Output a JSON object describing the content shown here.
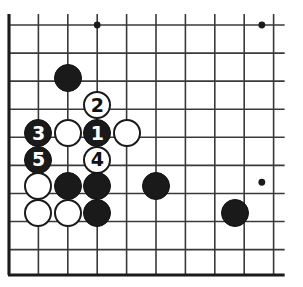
{
  "figure": {
    "kind": "go-board-diagram",
    "board": {
      "columns": 10,
      "rows": 10,
      "cell_size": 29.4,
      "origin_x": 9,
      "origin_y": 25,
      "line_color": "#3a3a3a",
      "border_color": "#1a1a1a",
      "background_color": "#ffffff",
      "edges": {
        "left": true,
        "bottom": true,
        "top": false,
        "right": false
      }
    },
    "star_points": [
      {
        "col": 3,
        "row": 0
      },
      {
        "col": 8.6,
        "row": 0
      },
      {
        "col": 8.6,
        "row": 5.6
      }
    ],
    "stones": [
      {
        "id": "b-a",
        "color": "black",
        "label": "",
        "col": 2,
        "row": 1.9
      },
      {
        "id": "w-2",
        "color": "white",
        "label": "2",
        "col": 3,
        "row": 2.85
      },
      {
        "id": "b-3",
        "color": "black",
        "label": "3",
        "col": 1,
        "row": 3.85
      },
      {
        "id": "w-b",
        "color": "white",
        "label": "",
        "col": 2,
        "row": 3.85
      },
      {
        "id": "b-1",
        "color": "black",
        "label": "1",
        "col": 3,
        "row": 3.85
      },
      {
        "id": "w-c",
        "color": "white",
        "label": "",
        "col": 4,
        "row": 3.85
      },
      {
        "id": "b-5",
        "color": "black",
        "label": "5",
        "col": 1,
        "row": 4.8
      },
      {
        "id": "w-4",
        "color": "white",
        "label": "4",
        "col": 3,
        "row": 4.8
      },
      {
        "id": "w-d",
        "color": "white",
        "label": "",
        "col": 1,
        "row": 5.75
      },
      {
        "id": "b-e",
        "color": "black",
        "label": "",
        "col": 2,
        "row": 5.75
      },
      {
        "id": "b-f",
        "color": "black",
        "label": "",
        "col": 3,
        "row": 5.75
      },
      {
        "id": "b-g",
        "color": "black",
        "label": "",
        "col": 5,
        "row": 5.75
      },
      {
        "id": "w-h",
        "color": "white",
        "label": "",
        "col": 1,
        "row": 6.7
      },
      {
        "id": "w-i",
        "color": "white",
        "label": "",
        "col": 2,
        "row": 6.7
      },
      {
        "id": "b-j",
        "color": "black",
        "label": "",
        "col": 3,
        "row": 6.7
      },
      {
        "id": "b-k",
        "color": "black",
        "label": "",
        "col": 7.7,
        "row": 6.7
      }
    ],
    "move_sequence": [
      "1",
      "2",
      "3",
      "4",
      "5"
    ],
    "colors": {
      "black_stone": "#1a1a1a",
      "white_stone": "#ffffff",
      "stone_outline": "#1a1a1a",
      "grid": "#3a3a3a"
    }
  }
}
